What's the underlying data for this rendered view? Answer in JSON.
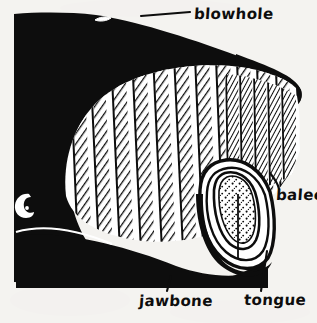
{
  "figure": {
    "style": "hand-drawn ink illustration",
    "background_color": "#f7f6f4",
    "ink_color": "#0d0d0d",
    "paper_color": "#ffffff",
    "width": 317,
    "height": 323
  },
  "labels": {
    "blowhole": "blowhole",
    "baleen": "baleen",
    "tongue": "tongue",
    "jawbone": "jawbone"
  },
  "parts": [
    {
      "name": "blowhole",
      "label": "blowhole",
      "description": "small white slit on top of the head",
      "leader_from": [
        141,
        15
      ],
      "leader_to": [
        190,
        12
      ]
    },
    {
      "name": "baleen",
      "label": "baleen",
      "description": "hatched plates hanging from the upper jaw",
      "leader_from": [
        271,
        174
      ],
      "leader_to": [
        279,
        189
      ]
    },
    {
      "name": "tongue",
      "label": "tongue",
      "description": "stippled teardrop inside the lower jaw",
      "leader_from": [
        266,
        252
      ],
      "leader_to": [
        261,
        291
      ]
    },
    {
      "name": "jawbone",
      "label": "jawbone",
      "description": "lower jaw outline along the bottom of the head",
      "leader_from": [
        171,
        277
      ],
      "leader_to": [
        167,
        291
      ]
    },
    {
      "name": "eye",
      "label": "",
      "description": "white crescent eye outline low on the left side of the head",
      "leader_from": [
        0,
        0
      ],
      "leader_to": [
        0,
        0
      ]
    }
  ]
}
